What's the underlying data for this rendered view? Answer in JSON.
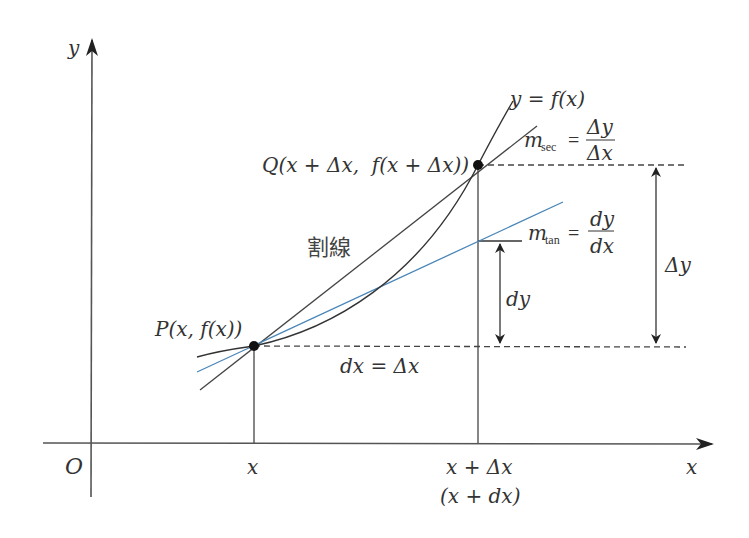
{
  "diagram": {
    "axes": {
      "x_label": "x",
      "y_label": "y",
      "origin_label": "O"
    },
    "curve": {
      "label": "y = f(x)"
    },
    "points": {
      "P": {
        "label": "P(x, f(x))"
      },
      "Q": {
        "label": "Q(x + Δx,  f(x + Δx))"
      }
    },
    "secant": {
      "label": "割線",
      "slope_symbol": "m",
      "slope_subscript": "sec",
      "equals": "=",
      "numerator": "Δy",
      "denominator": "Δx"
    },
    "tangent": {
      "slope_symbol": "m",
      "slope_subscript": "tan",
      "equals": "=",
      "numerator": "dy",
      "denominator": "dx"
    },
    "annotations": {
      "dx_eq": "dx = Δx",
      "dy": "dy",
      "delta_y": "Δy"
    },
    "ticks": {
      "x_tick": "x",
      "x_plus_dx_tick": "x + Δx",
      "x_plus_dx_alt": "(x + dx)"
    },
    "colors": {
      "axis": "#333333",
      "curve": "#333333",
      "secant": "#444444",
      "tangent": "#4a86b8",
      "point": "#111111",
      "dashed": "#444444"
    }
  }
}
